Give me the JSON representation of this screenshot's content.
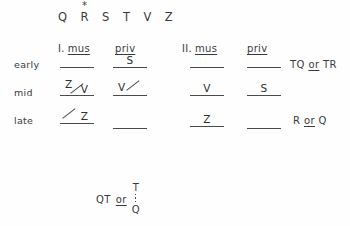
{
  "figure": {
    "background_color": "#fefefe",
    "ink_color": "#3a3a3a"
  },
  "symbol_header": {
    "symbols": [
      "Q",
      "R",
      "S",
      "T",
      "V",
      "Z"
    ],
    "starred_symbol": "R",
    "star_glyph": "*"
  },
  "groups": [
    {
      "numeral": "I.",
      "columns": [
        {
          "label": "mus",
          "underlined": true
        },
        {
          "label": "priv",
          "underlined": true
        }
      ]
    },
    {
      "numeral": "II.",
      "columns": [
        {
          "label": "mus",
          "underlined": true
        },
        {
          "label": "priv",
          "underlined": true
        }
      ]
    }
  ],
  "rows": [
    {
      "label": "early",
      "cells": [
        {
          "value": "",
          "slash": "none"
        },
        {
          "value": "S",
          "slash": "none"
        },
        {
          "value": "",
          "slash": "none"
        },
        {
          "value": "",
          "slash": "none"
        }
      ],
      "annotation": {
        "left": "TQ",
        "connector": "or",
        "right": "TR"
      }
    },
    {
      "label": "mid",
      "cells": [
        {
          "value": "Z",
          "value2": "V",
          "slash": "between"
        },
        {
          "value": "V",
          "slash": "trailing"
        },
        {
          "value": "V",
          "slash": "none"
        },
        {
          "value": "S",
          "slash": "none"
        }
      ],
      "annotation": null
    },
    {
      "label": "late",
      "cells": [
        {
          "value": "Z",
          "slash": "leading"
        },
        {
          "value": "",
          "slash": "none"
        },
        {
          "value": "Z",
          "slash": "none"
        },
        {
          "value": "",
          "slash": "none"
        }
      ],
      "annotation": {
        "left": "R",
        "connector": "or",
        "right": "Q"
      }
    }
  ],
  "formula": {
    "lead": "QT",
    "connector": "or",
    "numerator": "T",
    "denominator": "Q"
  }
}
